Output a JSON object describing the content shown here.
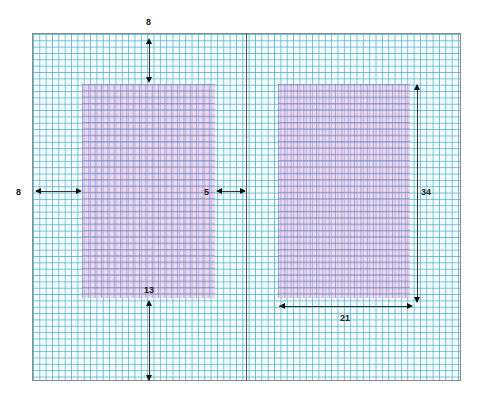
{
  "diagram": {
    "colors": {
      "grid": "#46aac8",
      "page_fill": "#eeaad7",
      "fold": "#555555",
      "arrow": "#111111"
    },
    "measurements": {
      "top_margin": "8",
      "outer_margin": "8",
      "gutter_margin": "5",
      "bottom_margin": "13",
      "page_height": "34",
      "page_width": "21"
    }
  }
}
